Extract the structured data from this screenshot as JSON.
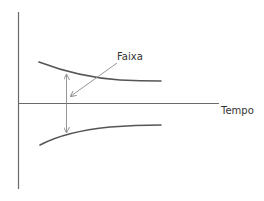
{
  "diagram": {
    "type": "funnel-band-over-time",
    "labels": {
      "band": "Faixa",
      "x_axis": "Tempo"
    },
    "colors": {
      "axes": "#6a6a6a",
      "curves": "#555555",
      "arrows": "#8a8a8a",
      "text": "#333333",
      "background": "#ffffff"
    },
    "elements": {
      "y_axis": {
        "x": 18.5,
        "y1": 12,
        "y2": 189
      },
      "x_axis": {
        "y": 103.5,
        "x1": 18,
        "x2": 219
      },
      "upper_curve": {
        "start": [
          39,
          62
        ],
        "end": [
          161,
          81
        ],
        "shape": "decreasing, flattening"
      },
      "lower_curve": {
        "start": [
          40,
          145
        ],
        "end": [
          161,
          125
        ],
        "shape": "increasing, flattening"
      },
      "band_width_arrow": {
        "x": 66.5,
        "y1": 74,
        "y2": 133,
        "heads": "both"
      },
      "faixa_pointer": {
        "from": [
          117,
          63
        ],
        "to": [
          70,
          97
        ],
        "heads": "end"
      }
    }
  }
}
